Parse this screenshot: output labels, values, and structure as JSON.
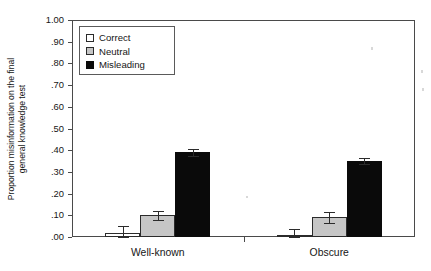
{
  "chart_data": {
    "type": "bar",
    "title": "",
    "subtitle": "",
    "xlabel": "",
    "ylabel": "Proportion misinformation on the final general knowledge test",
    "ylabel_lines": [
      "Proportion misinformation on the final",
      "general knowledge test"
    ],
    "categories": [
      "Well-known",
      "Obscure"
    ],
    "series": [
      {
        "name": "Correct",
        "color": "#ffffff",
        "values": [
          0.02,
          0.01
        ],
        "errors": [
          0.03,
          0.025
        ]
      },
      {
        "name": "Neutral",
        "color": "#c6c6c6",
        "values": [
          0.1,
          0.09
        ],
        "errors": [
          0.02,
          0.025
        ]
      },
      {
        "name": "Misleading",
        "color": "#0a0a0a",
        "values": [
          0.39,
          0.35
        ],
        "errors": [
          0.015,
          0.015
        ]
      }
    ],
    "ylim": [
      0.0,
      1.0
    ],
    "ytick_values": [
      1.0,
      0.9,
      0.8,
      0.7,
      0.6,
      0.5,
      0.4,
      0.3,
      0.2,
      0.1,
      0.0
    ],
    "ytick_labels": [
      "1.00",
      ".90",
      ".80",
      ".70",
      ".60",
      ".50",
      ".40",
      ".30",
      ".20",
      ".10",
      ".00"
    ],
    "grid": false,
    "legend_position": "upper-left",
    "legend_entries": [
      "Correct",
      "Neutral",
      "Misleading"
    ],
    "error_bars": true,
    "frame_color": "#4a4a4a",
    "background_color": "#ffffff"
  },
  "legend": {
    "items": [
      {
        "label": "Correct",
        "swatch": "correct"
      },
      {
        "label": "Neutral",
        "swatch": "neutral"
      },
      {
        "label": "Misleading",
        "swatch": "misleading"
      }
    ]
  },
  "axes": {
    "y": {
      "labels": [
        "1.00",
        ".90",
        ".80",
        ".70",
        ".60",
        ".50",
        ".40",
        ".30",
        ".20",
        ".10",
        ".00"
      ],
      "title_line1": "Proportion misinformation on the final",
      "title_line2": "general knowledge test"
    },
    "x": {
      "labels": [
        "Well-known",
        "Obscure"
      ]
    }
  }
}
